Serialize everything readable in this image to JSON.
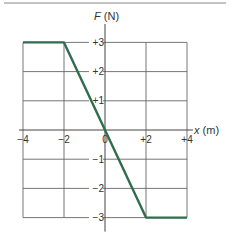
{
  "chart_data": {
    "type": "line",
    "title": "",
    "xlabel": "x (m)",
    "ylabel": "F (N)",
    "x_axis_label_var": "x",
    "x_axis_label_unit": "(m)",
    "y_axis_label_var": "F",
    "y_axis_label_unit": "(N)",
    "xlim": [
      -4,
      4
    ],
    "ylim": [
      -3,
      3
    ],
    "x_ticks": [
      "-4",
      "-2",
      "0",
      "+2",
      "+4"
    ],
    "y_ticks": [
      "+3",
      "+2",
      "+1",
      "-1",
      "-2",
      "-3"
    ],
    "grid": true,
    "series": [
      {
        "name": "F(x)",
        "color": "#2f6e4c",
        "x": [
          -4,
          -2,
          2,
          4
        ],
        "y": [
          3,
          3,
          -3,
          -3
        ]
      }
    ]
  }
}
